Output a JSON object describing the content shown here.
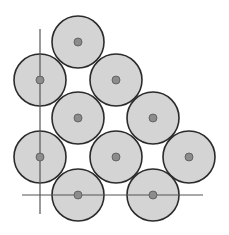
{
  "diagram": {
    "colors": {
      "background": "#ffffff",
      "circle_fill": "#d4d4d4",
      "circle_stroke": "#2b2b2b",
      "center_dot_fill": "#8c8c8c",
      "center_dot_stroke": "#555555",
      "axis_line": "#555555"
    },
    "circle_radius": 26,
    "dot_radius": 4,
    "circles": [
      {
        "cx": 78,
        "cy": 42
      },
      {
        "cx": 40,
        "cy": 80
      },
      {
        "cx": 116,
        "cy": 80
      },
      {
        "cx": 78,
        "cy": 118
      },
      {
        "cx": 153,
        "cy": 118
      },
      {
        "cx": 40,
        "cy": 157
      },
      {
        "cx": 116,
        "cy": 157
      },
      {
        "cx": 189,
        "cy": 157
      },
      {
        "cx": 78,
        "cy": 195
      },
      {
        "cx": 153,
        "cy": 195
      }
    ],
    "axes": {
      "horizontal": {
        "x1": 22,
        "y1": 195,
        "x2": 203,
        "y2": 195
      },
      "vertical": {
        "x1": 40,
        "y1": 29,
        "x2": 40,
        "y2": 214
      }
    }
  }
}
